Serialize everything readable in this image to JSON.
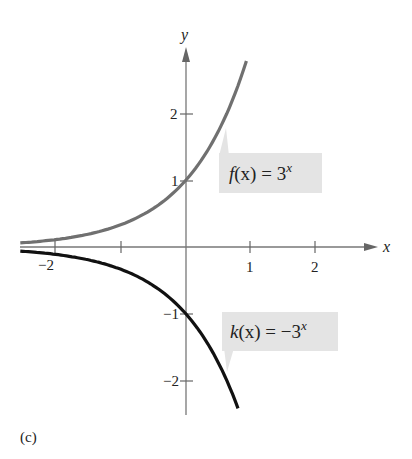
{
  "chart_data": {
    "type": "line",
    "title": "",
    "xlabel": "x",
    "ylabel": "y",
    "xlim": [
      -2.5,
      3
    ],
    "ylim": [
      -2.5,
      2.9
    ],
    "x_ticks": [
      -2,
      -1,
      1,
      2
    ],
    "x_tick_labels": [
      "-2",
      "",
      "1",
      "2"
    ],
    "y_ticks": [
      -2,
      -1,
      1,
      2
    ],
    "y_tick_labels": [
      "−2",
      "−1",
      "1",
      "2"
    ],
    "grid": false,
    "series": [
      {
        "name": "f(x) = 3^x",
        "formula": "3^x",
        "color": "#6e6e6e",
        "x": [
          -2.5,
          -2,
          -1.5,
          -1,
          -0.5,
          0,
          0.5,
          0.9
        ],
        "y": [
          0.06,
          0.11,
          0.19,
          0.33,
          0.58,
          1,
          1.73,
          2.69
        ]
      },
      {
        "name": "k(x) = -3^x",
        "formula": "-3^x",
        "color": "#111111",
        "x": [
          -2.5,
          -2,
          -1.5,
          -1,
          -0.5,
          0,
          0.5,
          0.8
        ],
        "y": [
          -0.06,
          -0.11,
          -0.19,
          -0.33,
          -0.58,
          -1,
          -1.73,
          -2.41
        ]
      }
    ],
    "annotations": [
      {
        "text": "f(x) = 3^x",
        "points_to": "f"
      },
      {
        "text": "k(x) = −3^x",
        "points_to": "k"
      }
    ]
  },
  "labels": {
    "x_axis": "x",
    "y_axis": "y",
    "xt_m2": "−2",
    "xt_1": "1",
    "xt_2": "2",
    "yt_2": "2",
    "yt_1": "1",
    "yt_m1": "−1",
    "yt_m2": "−2",
    "f_name": "f",
    "f_arg": "(x)",
    "f_eq": " = 3",
    "f_exp": "x",
    "k_name": "k",
    "k_arg": "(x)",
    "k_eq": " = −3",
    "k_exp": "x",
    "caption": "(c)"
  }
}
